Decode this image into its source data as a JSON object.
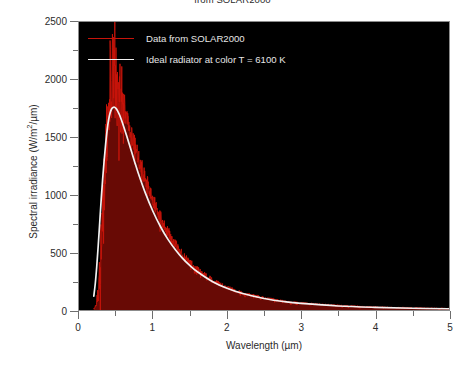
{
  "chart_data": {
    "type": "line",
    "title": "from SOLAR2000",
    "xlabel": "Wavelength (µm)",
    "ylabel_prefix": "Spectral irradiance (W/m",
    "ylabel_sup": "2",
    "ylabel_suffix": "/µm)",
    "ylabel": "Spectral irradiance (W/m2/µm)",
    "xlim": [
      0,
      5
    ],
    "ylim": [
      0,
      2500
    ],
    "grid": false,
    "legend_position": "upper-center-inside",
    "plot_background": "#000000",
    "xticks": [
      0,
      1,
      2,
      3,
      4,
      5
    ],
    "xtick_labels": [
      "0",
      "1",
      "2",
      "3",
      "4",
      "5"
    ],
    "xticks_minor": [
      0.5,
      1.5,
      2.5,
      3.5,
      4.5
    ],
    "yticks": [
      0,
      500,
      1000,
      1500,
      2000,
      2500
    ],
    "ytick_labels": [
      "0",
      "500",
      "1000",
      "1500",
      "2000",
      "2500"
    ],
    "yticks_minor": [
      250,
      750,
      1250,
      1750,
      2250
    ],
    "series": [
      {
        "name": "Data from SOLAR2000",
        "color": "#c8140a",
        "noisy": true,
        "peak_x": 0.47,
        "peak_y": 2150,
        "x": [
          0.2,
          0.22,
          0.24,
          0.26,
          0.28,
          0.3,
          0.32,
          0.34,
          0.36,
          0.38,
          0.4,
          0.42,
          0.44,
          0.46,
          0.48,
          0.5,
          0.52,
          0.55,
          0.6,
          0.65,
          0.7,
          0.75,
          0.8,
          0.9,
          1.0,
          1.1,
          1.2,
          1.3,
          1.4,
          1.5,
          1.6,
          1.8,
          2.0,
          2.2,
          2.5,
          2.8,
          3.0,
          3.5,
          4.0,
          4.5,
          5.0
        ],
        "y": [
          10,
          30,
          70,
          150,
          320,
          560,
          900,
          1150,
          1320,
          1500,
          1680,
          1850,
          1980,
          2150,
          2050,
          1930,
          1880,
          1820,
          1740,
          1640,
          1530,
          1430,
          1320,
          1130,
          960,
          810,
          680,
          570,
          480,
          410,
          350,
          260,
          195,
          150,
          105,
          72,
          60,
          38,
          25,
          17,
          12
        ]
      },
      {
        "name": "Ideal radiator at color T = 6100 K",
        "color": "#f2f2f2",
        "noisy": false,
        "peak_x": 0.48,
        "peak_y": 1760,
        "temperature_K": 6100,
        "x": [
          0.2,
          0.22,
          0.24,
          0.26,
          0.28,
          0.3,
          0.32,
          0.34,
          0.36,
          0.38,
          0.4,
          0.42,
          0.44,
          0.46,
          0.48,
          0.5,
          0.52,
          0.55,
          0.6,
          0.65,
          0.7,
          0.75,
          0.8,
          0.9,
          1.0,
          1.1,
          1.2,
          1.3,
          1.4,
          1.5,
          1.6,
          1.8,
          2.0,
          2.2,
          2.5,
          2.8,
          3.0,
          3.5,
          4.0,
          4.5,
          5.0
        ],
        "y": [
          120,
          230,
          380,
          560,
          760,
          960,
          1140,
          1300,
          1440,
          1560,
          1650,
          1710,
          1745,
          1758,
          1760,
          1750,
          1730,
          1690,
          1600,
          1500,
          1395,
          1290,
          1190,
          1010,
          855,
          725,
          615,
          525,
          448,
          385,
          332,
          248,
          188,
          145,
          100,
          70,
          57,
          35,
          23,
          15,
          11
        ]
      }
    ]
  },
  "legend": {
    "items": [
      {
        "label": "Data from SOLAR2000",
        "color": "#c8140a"
      },
      {
        "label": "Ideal radiator at color T = 6100 K",
        "color": "#f2f2f2"
      }
    ]
  }
}
